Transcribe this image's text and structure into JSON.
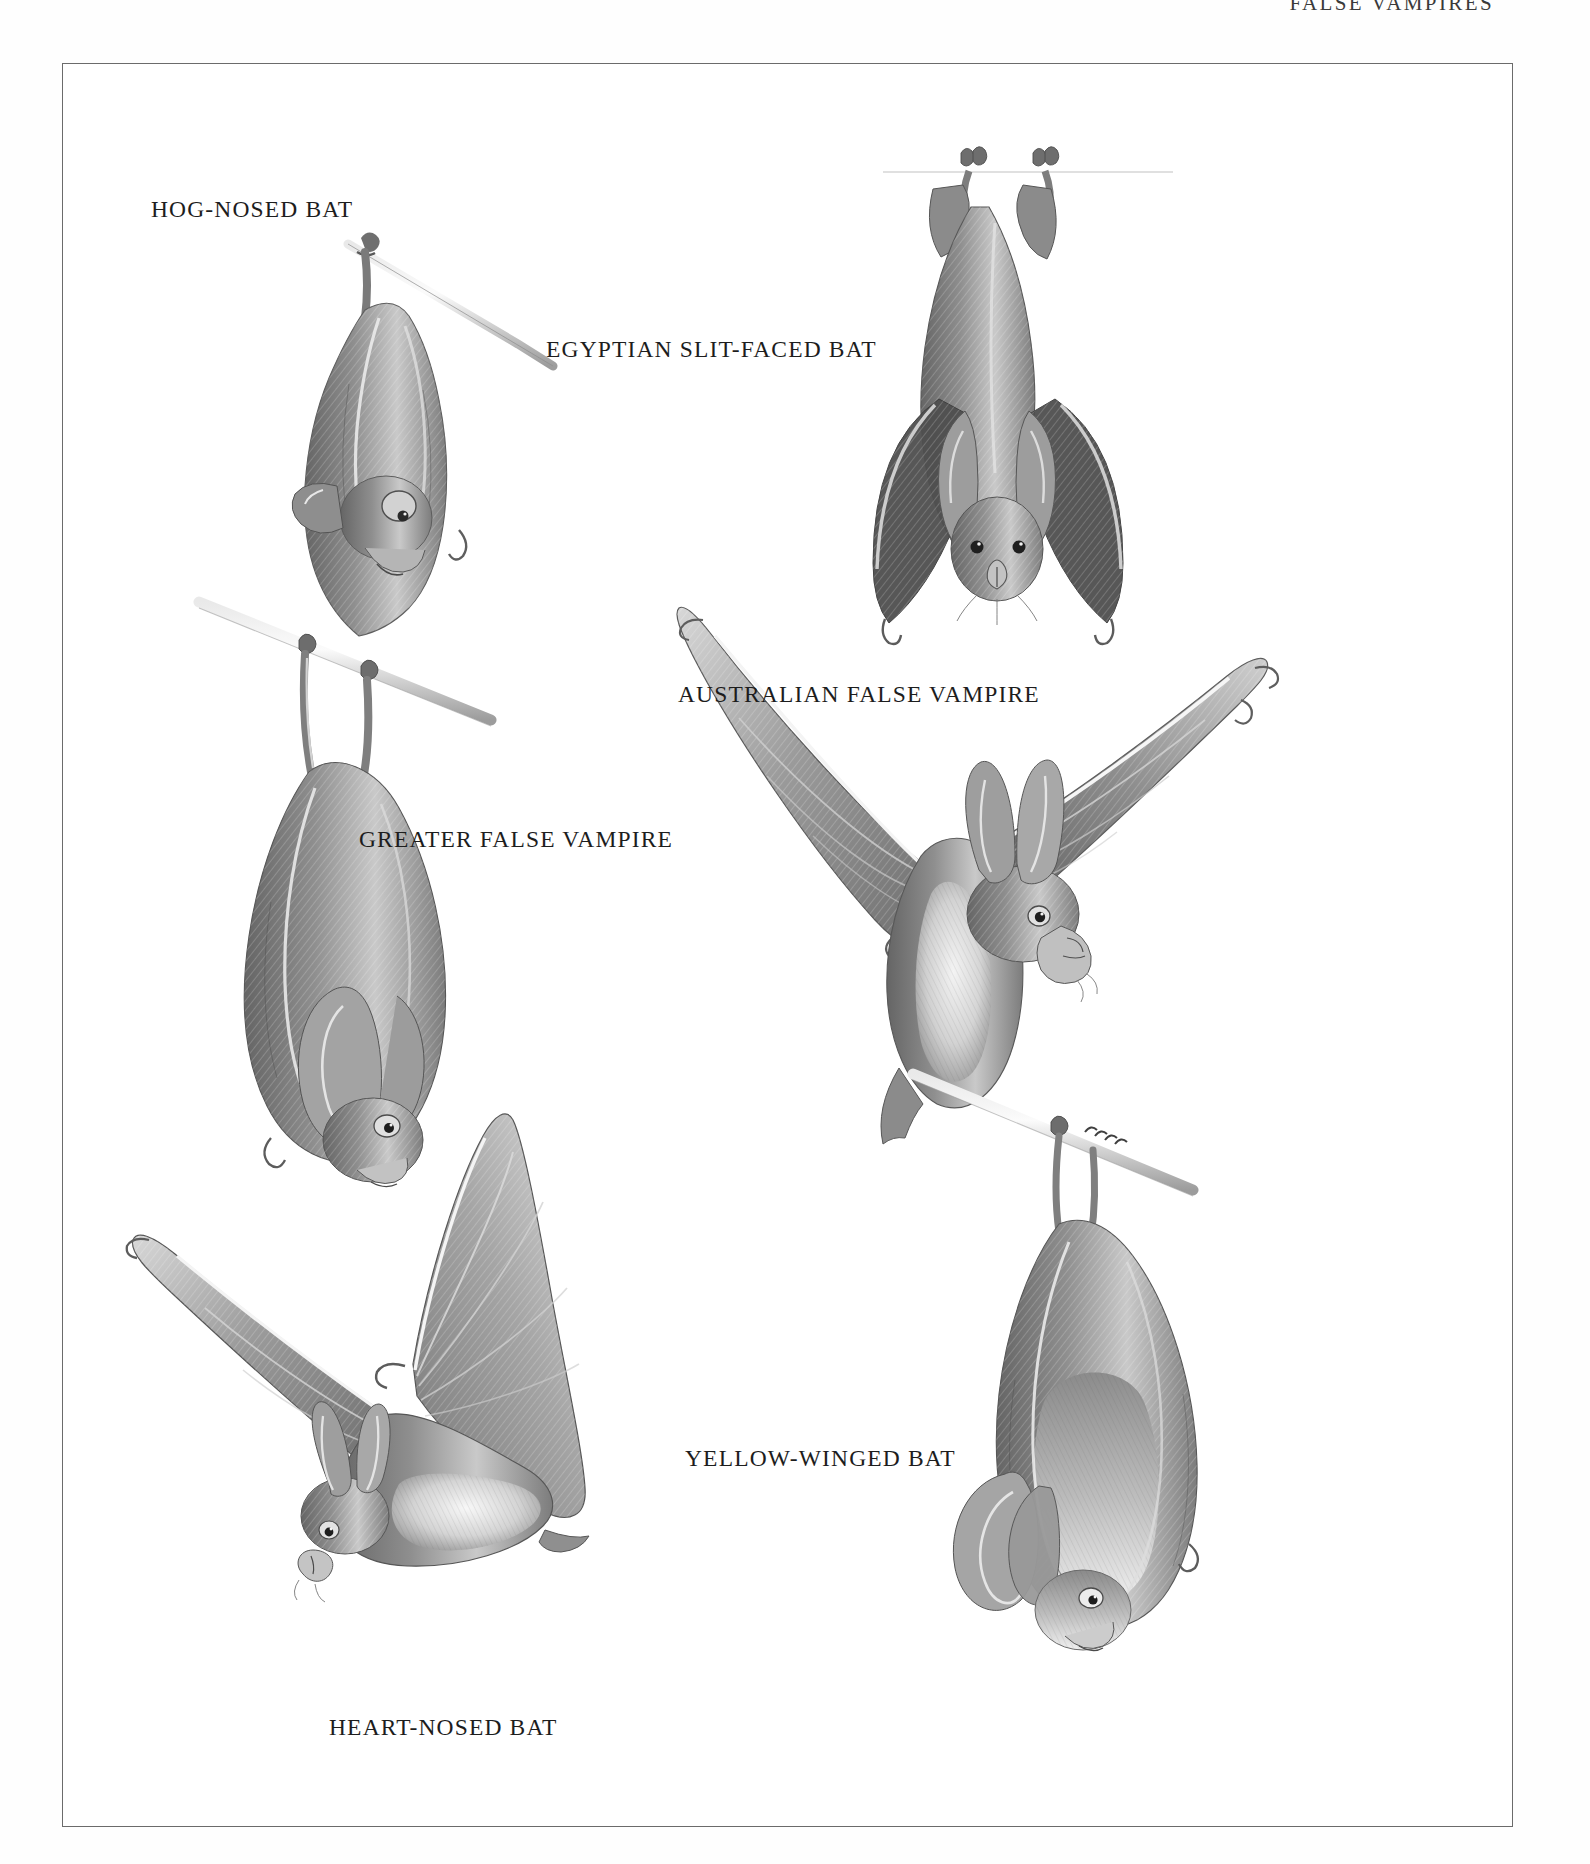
{
  "page": {
    "running_head": "FALSE VAMPIRES",
    "background_color": "#ffffff",
    "frame_color": "#6b6b6b",
    "ink_color": "#1d1d1d",
    "medium": "graphite pencil illustration"
  },
  "plate": {
    "figures": [
      {
        "id": "hog-nosed-bat",
        "label": "HOG-NOSED BAT",
        "label_x": 150,
        "label_y": 195,
        "pose": "hanging upside down from a twig",
        "fig_x": 240,
        "fig_y": 130,
        "fig_w": 300,
        "fig_h": 500
      },
      {
        "id": "egyptian-slit-faced-bat",
        "label": "EGYPTIAN SLIT-FACED BAT",
        "label_x": 645,
        "label_y": 335,
        "pose": "hanging upside down from a branch, wings folded, facing viewer",
        "fig_x": 930,
        "fig_y": 150,
        "fig_w": 340,
        "fig_h": 560
      },
      {
        "id": "australian-false-vampire",
        "label": "AUSTRALIAN FALSE VAMPIRE",
        "label_x": 805,
        "label_y": 680,
        "pose": "in flight, wings spread wide",
        "fig_x": 760,
        "fig_y": 650,
        "fig_w": 640,
        "fig_h": 560
      },
      {
        "id": "greater-false-vampire",
        "label": "GREATER FALSE VAMPIRE",
        "label_x": 420,
        "label_y": 825,
        "pose": "hanging upside down from a twig, large ears",
        "fig_x": 205,
        "fig_y": 670,
        "fig_w": 300,
        "fig_h": 580
      },
      {
        "id": "heart-nosed-bat",
        "label": "HEART-NOSED BAT",
        "label_x": 400,
        "label_y": 1713,
        "pose": "in flight, wings spread, seen from above",
        "fig_x": 130,
        "fig_y": 1170,
        "fig_w": 580,
        "fig_h": 560
      },
      {
        "id": "yellow-winged-bat",
        "label": "YELLOW-WINGED BAT",
        "label_x": 800,
        "label_y": 1444,
        "pose": "hanging upside down from a twig, pale chest",
        "fig_x": 960,
        "fig_y": 1140,
        "fig_w": 340,
        "fig_h": 540
      }
    ]
  }
}
